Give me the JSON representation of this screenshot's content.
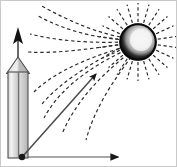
{
  "figure": {
    "width": 177,
    "height": 167,
    "background_color": "#ffffff",
    "border_color": "#c9c9c9"
  },
  "colors": {
    "ink": "#1a1a1a",
    "field_line": "#2b2b2b",
    "axis_gray": "#8a8a8a",
    "column_light": "#e8e8e8",
    "column_mid": "#c2c2c2",
    "column_dark": "#9a9a9a",
    "column_edge": "#4d4d4d",
    "sphere_dark": "#111111",
    "sphere_highlight": "#f2f2f2"
  },
  "sphere": {
    "name": "charged-sphere",
    "center_x": 138,
    "center_y": 42,
    "radius": 18,
    "highlight_offset_x": 3,
    "highlight_offset_y": -2,
    "highlight_radius": 11,
    "ray_count": 22,
    "ray_inner": 20,
    "ray_outer": 39
  },
  "column": {
    "name": "vertical-block-arrow",
    "left": 8,
    "right": 28,
    "top_body": 72,
    "bottom": 158,
    "tip_apex_y": 58,
    "stem_arrow_top_y": 28,
    "stem_arrow_base_y": 44,
    "center_x": 18
  },
  "axes": {
    "horizontal": {
      "name": "x-axis",
      "x1": 22,
      "y1": 157,
      "x2": 122,
      "y2": 157
    },
    "origin_dot": {
      "name": "origin-point",
      "x": 22,
      "y": 157,
      "radius": 3.2
    }
  },
  "diagonal_arrow": {
    "name": "field-direction-arrow",
    "x1": 23,
    "y1": 156,
    "x2": 99,
    "y2": 71
  },
  "field_lines": [
    {
      "id": "line-1",
      "d": "M 126 38 C 100 34 70 22 40 5"
    },
    {
      "id": "line-2",
      "d": "M 125 40 C 98 38 68 32 38 16"
    },
    {
      "id": "line-3",
      "d": "M 124 42 C 96 43 62 42 30 34"
    },
    {
      "id": "line-4",
      "d": "M 124 44 C 95 48 58 54 28 52"
    },
    {
      "id": "line-5",
      "d": "M 125 47 C 96 55 56 70 34 92"
    },
    {
      "id": "line-6",
      "d": "M 126 50 C 100 62 62 84 44 118"
    },
    {
      "id": "line-7",
      "d": "M 128 54 C 108 70 78 96 62 134"
    },
    {
      "id": "line-8",
      "d": "M 131 57 C 116 78 96 104 86 140"
    },
    {
      "id": "line-9",
      "d": "M 120 48 C 94 62 60 82 42 104"
    }
  ],
  "legend": {
    "sphere_label": "charged sphere",
    "column_label": "block arrow",
    "diagonal_label": "field direction arrow",
    "axis_label": "horizontal axis"
  }
}
